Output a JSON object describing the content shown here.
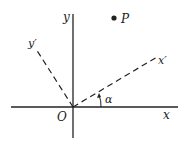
{
  "diagram": {
    "labels": {
      "y_axis": "y",
      "x_axis": "x",
      "origin": "O",
      "x_prime": "x′",
      "y_prime": "y′",
      "point": "P",
      "angle": "α"
    },
    "colors": {
      "stroke": "#222222",
      "background": "#ffffff"
    }
  }
}
